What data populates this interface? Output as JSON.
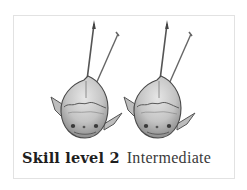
{
  "skill": {
    "level_label": "Skill level 2",
    "level_number": 2,
    "description": "Intermediate"
  },
  "figure": {
    "icon": "spearfish-icon",
    "count": 2,
    "colors": {
      "outline": "#4a4a4a",
      "body": "#c9c9c9",
      "shade": "#9a9a9a",
      "border": "#e2e2e2"
    }
  }
}
